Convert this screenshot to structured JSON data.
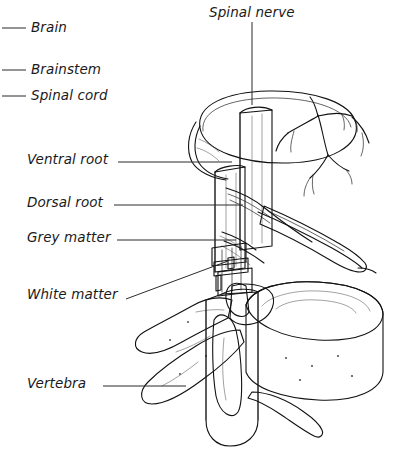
{
  "figure": {
    "title_text": "Spinal nerve",
    "kind": "anatomical-line-drawing",
    "background_color": "#ffffff",
    "ink_color": "#111111",
    "fill_light": "#f2f2f2",
    "fill_mid": "#c9c9c9",
    "fill_dark": "#9a9a9a",
    "stipple_color": "#6f6f6f"
  },
  "labels": {
    "spinal_nerve": "Spinal nerve",
    "brain": "Brain",
    "brainstem": "Brainstem",
    "spinal_cord": "Spinal cord",
    "ventral_root": "Ventral root",
    "dorsal_root": "Dorsal root",
    "grey_matter": "Grey matter",
    "white_matter": "White matter",
    "vertebra": "Vertebra"
  },
  "label_list": [
    {
      "key": "spinal_nerve",
      "text": "Spinal nerve",
      "x": 209,
      "y": 6,
      "leader": "vertical-down"
    },
    {
      "key": "brain",
      "text": "Brain",
      "x": 31,
      "y": 21,
      "leader": "short-left-dash"
    },
    {
      "key": "brainstem",
      "text": "Brainstem",
      "x": 31,
      "y": 63,
      "leader": "short-left-dash"
    },
    {
      "key": "spinal_cord",
      "text": "Spinal cord",
      "x": 31,
      "y": 89,
      "leader": "short-left-dash"
    },
    {
      "key": "ventral_root",
      "text": "Ventral root",
      "x": 27,
      "y": 153,
      "leader": "right-horizontal"
    },
    {
      "key": "dorsal_root",
      "text": "Dorsal root",
      "x": 27,
      "y": 196,
      "leader": "right-horizontal"
    },
    {
      "key": "grey_matter",
      "text": "Grey matter",
      "x": 27,
      "y": 231,
      "leader": "right-horizontal"
    },
    {
      "key": "white_matter",
      "text": "White matter",
      "x": 27,
      "y": 288,
      "leader": "right-diagonal-up"
    },
    {
      "key": "vertebra",
      "text": "Vertebra",
      "x": 27,
      "y": 377,
      "leader": "right-horizontal"
    }
  ],
  "leader_lines": [
    {
      "name": "brain-leader",
      "x1": 2,
      "y1": 28,
      "x2": 26,
      "y2": 28
    },
    {
      "name": "brainstem-leader",
      "x1": 2,
      "y1": 70,
      "x2": 26,
      "y2": 70
    },
    {
      "name": "spinal-cord-leader",
      "x1": 2,
      "y1": 96,
      "x2": 26,
      "y2": 96
    },
    {
      "name": "spinal-nerve-leader",
      "x1": 252,
      "y1": 22,
      "x2": 252,
      "y2": 105
    },
    {
      "name": "ventral-root-leader",
      "x1": 118,
      "y1": 162,
      "x2": 232,
      "y2": 162
    },
    {
      "name": "dorsal-root-leader",
      "x1": 114,
      "y1": 205,
      "x2": 243,
      "y2": 205
    },
    {
      "name": "grey-matter-leader",
      "x1": 117,
      "y1": 240,
      "x2": 236,
      "y2": 240
    },
    {
      "name": "white-matter-leader",
      "x1": 126,
      "y1": 299,
      "x2": 228,
      "y2": 261
    },
    {
      "name": "vertebra-leader",
      "x1": 103,
      "y1": 386,
      "x2": 186,
      "y2": 386
    }
  ]
}
